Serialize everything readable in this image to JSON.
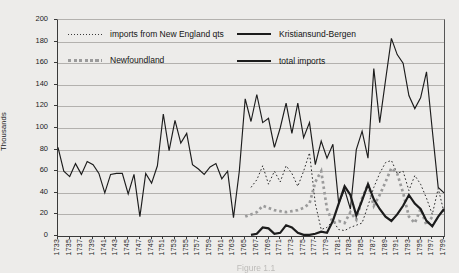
{
  "figure": {
    "y_axis": {
      "title": "Thousands",
      "ticks": [
        "0",
        "20",
        "40",
        "60",
        "80",
        "100",
        "120",
        "140",
        "160",
        "180",
        "200"
      ]
    },
    "x_axis": {
      "tick_labels": [
        "1733",
        "1735",
        "1737",
        "1739",
        "1741",
        "1743",
        "1745",
        "1747",
        "1749",
        "1751",
        "1753",
        "1755",
        "1757",
        "1759",
        "1761",
        "1763",
        "1765",
        "1767",
        "1769",
        "1771",
        "1773",
        "1775",
        "1777",
        "1779",
        "1781",
        "1783",
        "1785",
        "1787",
        "1789",
        "1791",
        "1793",
        "1795",
        "1797",
        "1799"
      ]
    },
    "legend": [
      {
        "label": "imports from New England qts",
        "style": "fine-dotted-black-line"
      },
      {
        "label": "Newfoundland",
        "style": "thick-gray-dotted-line"
      },
      {
        "label": "Kristiansund-Bergen",
        "style": "thick-solid-black-line"
      },
      {
        "label": "total imports",
        "style": "thin-solid-black-line"
      }
    ],
    "caption_fragment": "Figure 1.1",
    "colors": {
      "line_black": "#1c1c1c",
      "line_gray": "#9b9b9b",
      "gridline": "#b3b1ae",
      "background": "#edecea"
    }
  },
  "chart_data": {
    "type": "line",
    "title": "",
    "xlabel": "",
    "ylabel": "Thousands",
    "ylim": [
      0,
      200
    ],
    "grid": "horizontal",
    "legend_position": "top-inside-two-columns",
    "x": [
      1733,
      1734,
      1735,
      1736,
      1737,
      1738,
      1739,
      1740,
      1741,
      1742,
      1743,
      1744,
      1745,
      1746,
      1747,
      1748,
      1749,
      1750,
      1751,
      1752,
      1753,
      1754,
      1755,
      1756,
      1757,
      1758,
      1759,
      1760,
      1761,
      1762,
      1763,
      1764,
      1765,
      1766,
      1767,
      1768,
      1769,
      1770,
      1771,
      1772,
      1773,
      1774,
      1775,
      1776,
      1777,
      1778,
      1779,
      1780,
      1781,
      1782,
      1783,
      1784,
      1785,
      1786,
      1787,
      1788,
      1789,
      1790,
      1791,
      1792,
      1793,
      1794,
      1795,
      1796,
      1797,
      1798,
      1799
    ],
    "series": [
      {
        "name": "imports from New England qts",
        "style": "dotted",
        "color": "#2a2a2a",
        "values": [
          null,
          null,
          null,
          null,
          null,
          null,
          null,
          null,
          null,
          null,
          null,
          null,
          null,
          null,
          null,
          null,
          null,
          null,
          null,
          null,
          null,
          null,
          null,
          null,
          null,
          null,
          null,
          null,
          null,
          null,
          null,
          null,
          null,
          45,
          52,
          65,
          48,
          60,
          50,
          65,
          58,
          46,
          60,
          77,
          30,
          6,
          8,
          14,
          6,
          5,
          8,
          10,
          12,
          28,
          45,
          58,
          68,
          70,
          58,
          60,
          42,
          56,
          48,
          35,
          20,
          44,
          22
        ]
      },
      {
        "name": "Newfoundland",
        "style": "thick-dotted",
        "color": "#9b9b9b",
        "values": [
          null,
          null,
          null,
          null,
          null,
          null,
          null,
          null,
          null,
          null,
          null,
          null,
          null,
          null,
          null,
          null,
          null,
          null,
          null,
          null,
          null,
          null,
          null,
          null,
          null,
          null,
          null,
          null,
          null,
          null,
          null,
          null,
          18,
          20,
          22,
          28,
          26,
          24,
          23,
          22,
          23,
          24,
          26,
          30,
          50,
          60,
          25,
          12,
          14,
          12,
          22,
          15,
          35,
          48,
          28,
          38,
          50,
          63,
          58,
          40,
          18,
          12,
          25,
          10,
          18,
          null,
          null
        ]
      },
      {
        "name": "Kristiansund-Bergen",
        "style": "solid-thick",
        "color": "#1c1c1c",
        "values": [
          null,
          null,
          null,
          null,
          null,
          null,
          null,
          null,
          null,
          null,
          null,
          null,
          null,
          null,
          null,
          null,
          null,
          null,
          null,
          null,
          null,
          null,
          null,
          null,
          null,
          null,
          null,
          null,
          null,
          null,
          null,
          null,
          null,
          1,
          2,
          8,
          7,
          2,
          3,
          10,
          8,
          3,
          1,
          1,
          2,
          4,
          3,
          14,
          30,
          46,
          38,
          19,
          33,
          48,
          34,
          25,
          18,
          14,
          20,
          28,
          38,
          30,
          25,
          14,
          9,
          18,
          25
        ]
      },
      {
        "name": "total imports",
        "style": "solid-thin",
        "color": "#1c1c1c",
        "values": [
          82,
          60,
          55,
          67,
          57,
          69,
          66,
          58,
          40,
          57,
          58,
          58,
          39,
          57,
          18,
          58,
          49,
          65,
          113,
          79,
          107,
          86,
          95,
          66,
          62,
          57,
          64,
          67,
          53,
          60,
          17,
          60,
          127,
          106,
          131,
          105,
          109,
          82,
          100,
          123,
          95,
          123,
          91,
          105,
          66,
          88,
          72,
          85,
          30,
          43,
          25,
          80,
          97,
          72,
          155,
          105,
          144,
          183,
          168,
          160,
          130,
          118,
          128,
          152,
          98,
          45,
          40
        ]
      }
    ]
  }
}
